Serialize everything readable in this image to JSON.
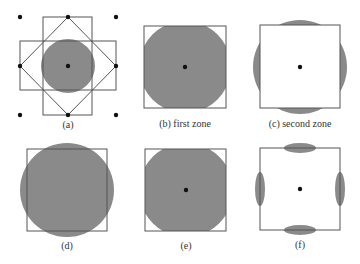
{
  "colors": {
    "background": "#ffffff",
    "zone_fill": "#8a8a8a",
    "frame_stroke": "#555555",
    "dot": "#111111",
    "label": "#333333"
  },
  "panels": [
    {
      "id": "a",
      "label": "(a)",
      "description": "lattice points with first and second Brillouin zone construction"
    },
    {
      "id": "b",
      "label": "(b) first zone",
      "description": "Fermi circle in first zone"
    },
    {
      "id": "c",
      "label": "(c) second zone",
      "description": "Fermi circle pieces in second zone"
    },
    {
      "id": "d",
      "label": "(d)",
      "description": ""
    },
    {
      "id": "e",
      "label": "(e)",
      "description": ""
    },
    {
      "id": "f",
      "label": "(f)",
      "description": ""
    }
  ]
}
